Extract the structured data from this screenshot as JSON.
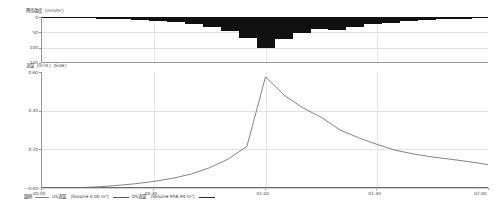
{
  "chart_data": [
    {
      "type": "bar",
      "id": "rainfall-hyetograph",
      "title": "",
      "ylabel": "降雨強度（mm/hr）",
      "xlabel": "",
      "orientation": "inverted",
      "ylim": [
        0,
        150
      ],
      "yticks": [
        "0",
        "50",
        "100",
        "150"
      ],
      "ytick_values": [
        0,
        50,
        100,
        150
      ],
      "xlim": [
        "00:00",
        "02:00"
      ],
      "xticks": [
        "00:00",
        "00:30",
        "01:00",
        "01:30",
        "02:00"
      ],
      "grid": true,
      "bar_color": "#101010",
      "categories": [
        "00:00",
        "00:05",
        "00:10",
        "00:15",
        "00:20",
        "00:25",
        "00:30",
        "00:35",
        "00:40",
        "00:45",
        "00:50",
        "00:55",
        "01:00",
        "01:05",
        "01:10",
        "01:15",
        "01:20",
        "01:25",
        "01:30",
        "01:35",
        "01:40",
        "01:45",
        "01:50",
        "01:55",
        "02:00"
      ],
      "values": [
        2,
        3,
        4,
        5,
        7,
        9,
        12,
        16,
        22,
        31,
        45,
        68,
        100,
        72,
        52,
        40,
        44,
        33,
        24,
        18,
        13,
        10,
        7,
        5,
        3
      ]
    },
    {
      "type": "line",
      "id": "discharge-hydrograph",
      "title": "",
      "ylabel": "流量（m³/s）（Side）",
      "xlabel": "",
      "ylim": [
        0.0,
        0.6
      ],
      "yticks": [
        "0.60",
        "0.40",
        "0.20",
        "0.00"
      ],
      "ytick_values": [
        0.6,
        0.4,
        0.2,
        0.0
      ],
      "xlim": [
        "00:00",
        "02:00"
      ],
      "xticks": [
        "00:00",
        "00:30",
        "01:00",
        "01:30",
        "02:00"
      ],
      "grid": true,
      "line_color": "#4d4d4d",
      "series": [
        {
          "name": "US流量",
          "volume_label": "Volume 0.00 m³",
          "values": []
        },
        {
          "name": "DS流量",
          "volume_label": "Volume 958.94 m³",
          "x": [
            "00:00",
            "00:05",
            "00:10",
            "00:15",
            "00:20",
            "00:25",
            "00:30",
            "00:35",
            "00:40",
            "00:45",
            "00:50",
            "00:55",
            "01:00",
            "01:05",
            "01:10",
            "01:15",
            "01:20",
            "01:25",
            "01:30",
            "01:35",
            "01:40",
            "01:45",
            "01:50",
            "01:55",
            "02:00"
          ],
          "values": [
            0.0,
            0.0,
            0.002,
            0.006,
            0.013,
            0.022,
            0.034,
            0.05,
            0.072,
            0.105,
            0.15,
            0.215,
            0.575,
            0.48,
            0.415,
            0.365,
            0.3,
            0.26,
            0.225,
            0.195,
            0.175,
            0.16,
            0.148,
            0.135,
            0.12
          ]
        }
      ]
    }
  ],
  "rainfall": {
    "axis_label": "降雨強度（mm/hr）",
    "yticks": [
      "0",
      "50",
      "100",
      "150"
    ]
  },
  "flow": {
    "axis_label": "流量（m³/s）（Side）",
    "yticks": [
      "0.60",
      "0.40",
      "0.20",
      "0.00"
    ],
    "xticks": [
      "00:00",
      "00:30",
      "01:00",
      "01:30",
      "02:00"
    ]
  },
  "legend": {
    "title": "圖例",
    "items": [
      {
        "name": "US流量",
        "detail": "（Volume 0.00 m³）"
      },
      {
        "name": "DS流量",
        "detail": "（Volume 958.94 m³）"
      }
    ]
  }
}
